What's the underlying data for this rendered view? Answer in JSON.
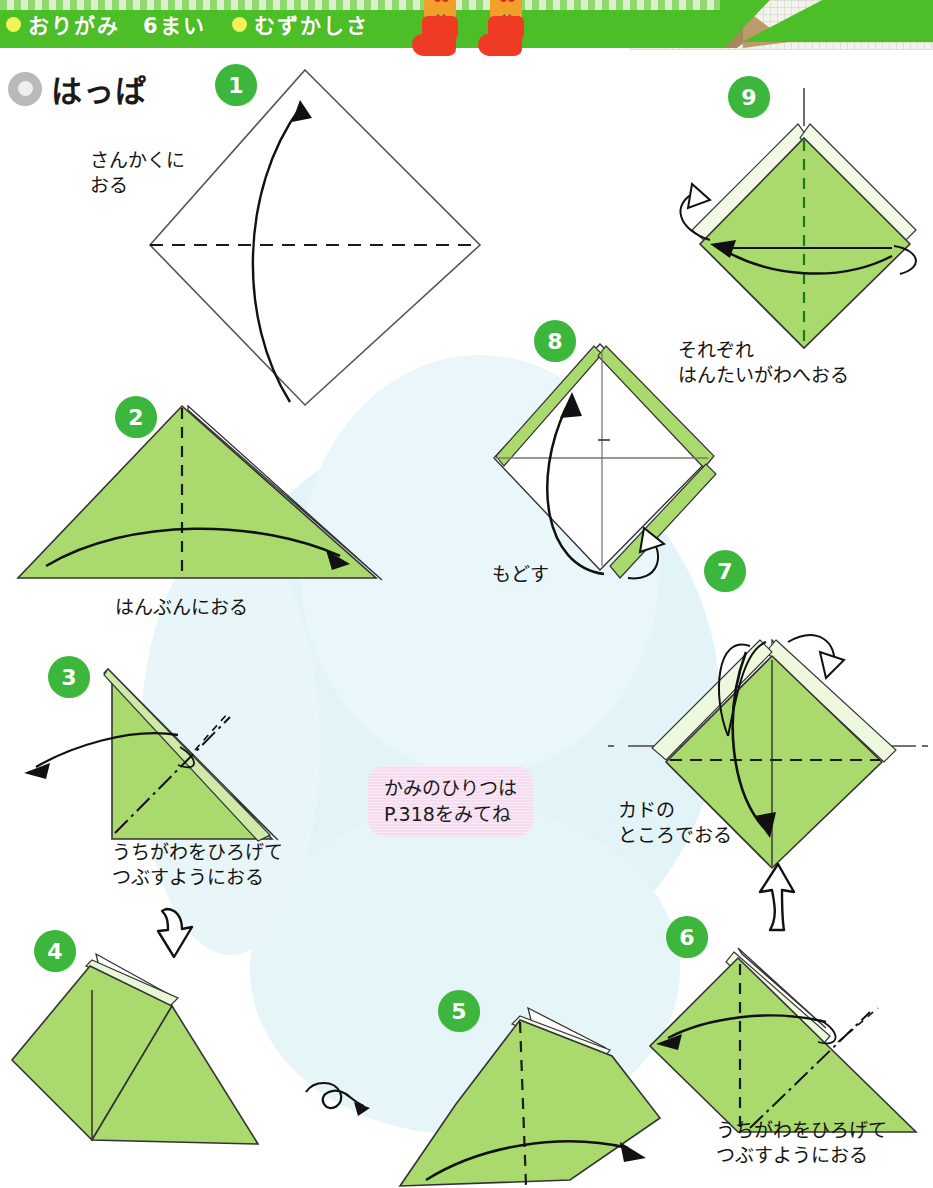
{
  "header": {
    "items": [
      {
        "label": "おりがみ　6まい",
        "bullet": "yellow-dot"
      },
      {
        "label": "むずかしさ",
        "bullet": "yellow-dot"
      }
    ],
    "decorations": [
      "christmas-stocking",
      "christmas-stocking",
      "folded-paper-photo"
    ],
    "band_color": "#4cbe28"
  },
  "title": {
    "icon": "gray-ring-icon",
    "text": "はっぱ"
  },
  "note": {
    "text": "かみのひりつは\nP.318をみてね",
    "background": "#f6dcf0"
  },
  "colors": {
    "paper_green": "#aada6e",
    "paper_green_dark": "#8ec84d",
    "badge_green": "#3cb63c",
    "background_wash": "#e3f4f8",
    "line": "#1a1a1a"
  },
  "steps": [
    {
      "number": "1",
      "caption": "さんかくに\nおる",
      "shape": "white-diamond"
    },
    {
      "number": "2",
      "caption": "はんぶんにおる",
      "shape": "green-triangle"
    },
    {
      "number": "3",
      "caption": "うちがわをひろげて\nつぶすようにおる",
      "shape": "green-right-triangle"
    },
    {
      "number": "4",
      "caption": "",
      "shape": "green-kite"
    },
    {
      "number": "5",
      "caption": "",
      "shape": "green-tilted-kite"
    },
    {
      "number": "6",
      "caption": "うちがわをひろげて\nつぶすようにおる",
      "shape": "green-wide-triangle"
    },
    {
      "number": "7",
      "caption": "カドの\nところでおる",
      "shape": "green-diamond"
    },
    {
      "number": "8",
      "caption": "もどす",
      "shape": "white-diamond-green-edges"
    },
    {
      "number": "9",
      "caption": "それぞれ\nはんたいがわへおる",
      "shape": "green-diamond-layered"
    }
  ],
  "icons": {
    "turn_over": "turn-over-loop-icon",
    "proceed_down": "hollow-arrow-down-icon",
    "proceed_up": "hollow-arrow-up-icon"
  }
}
